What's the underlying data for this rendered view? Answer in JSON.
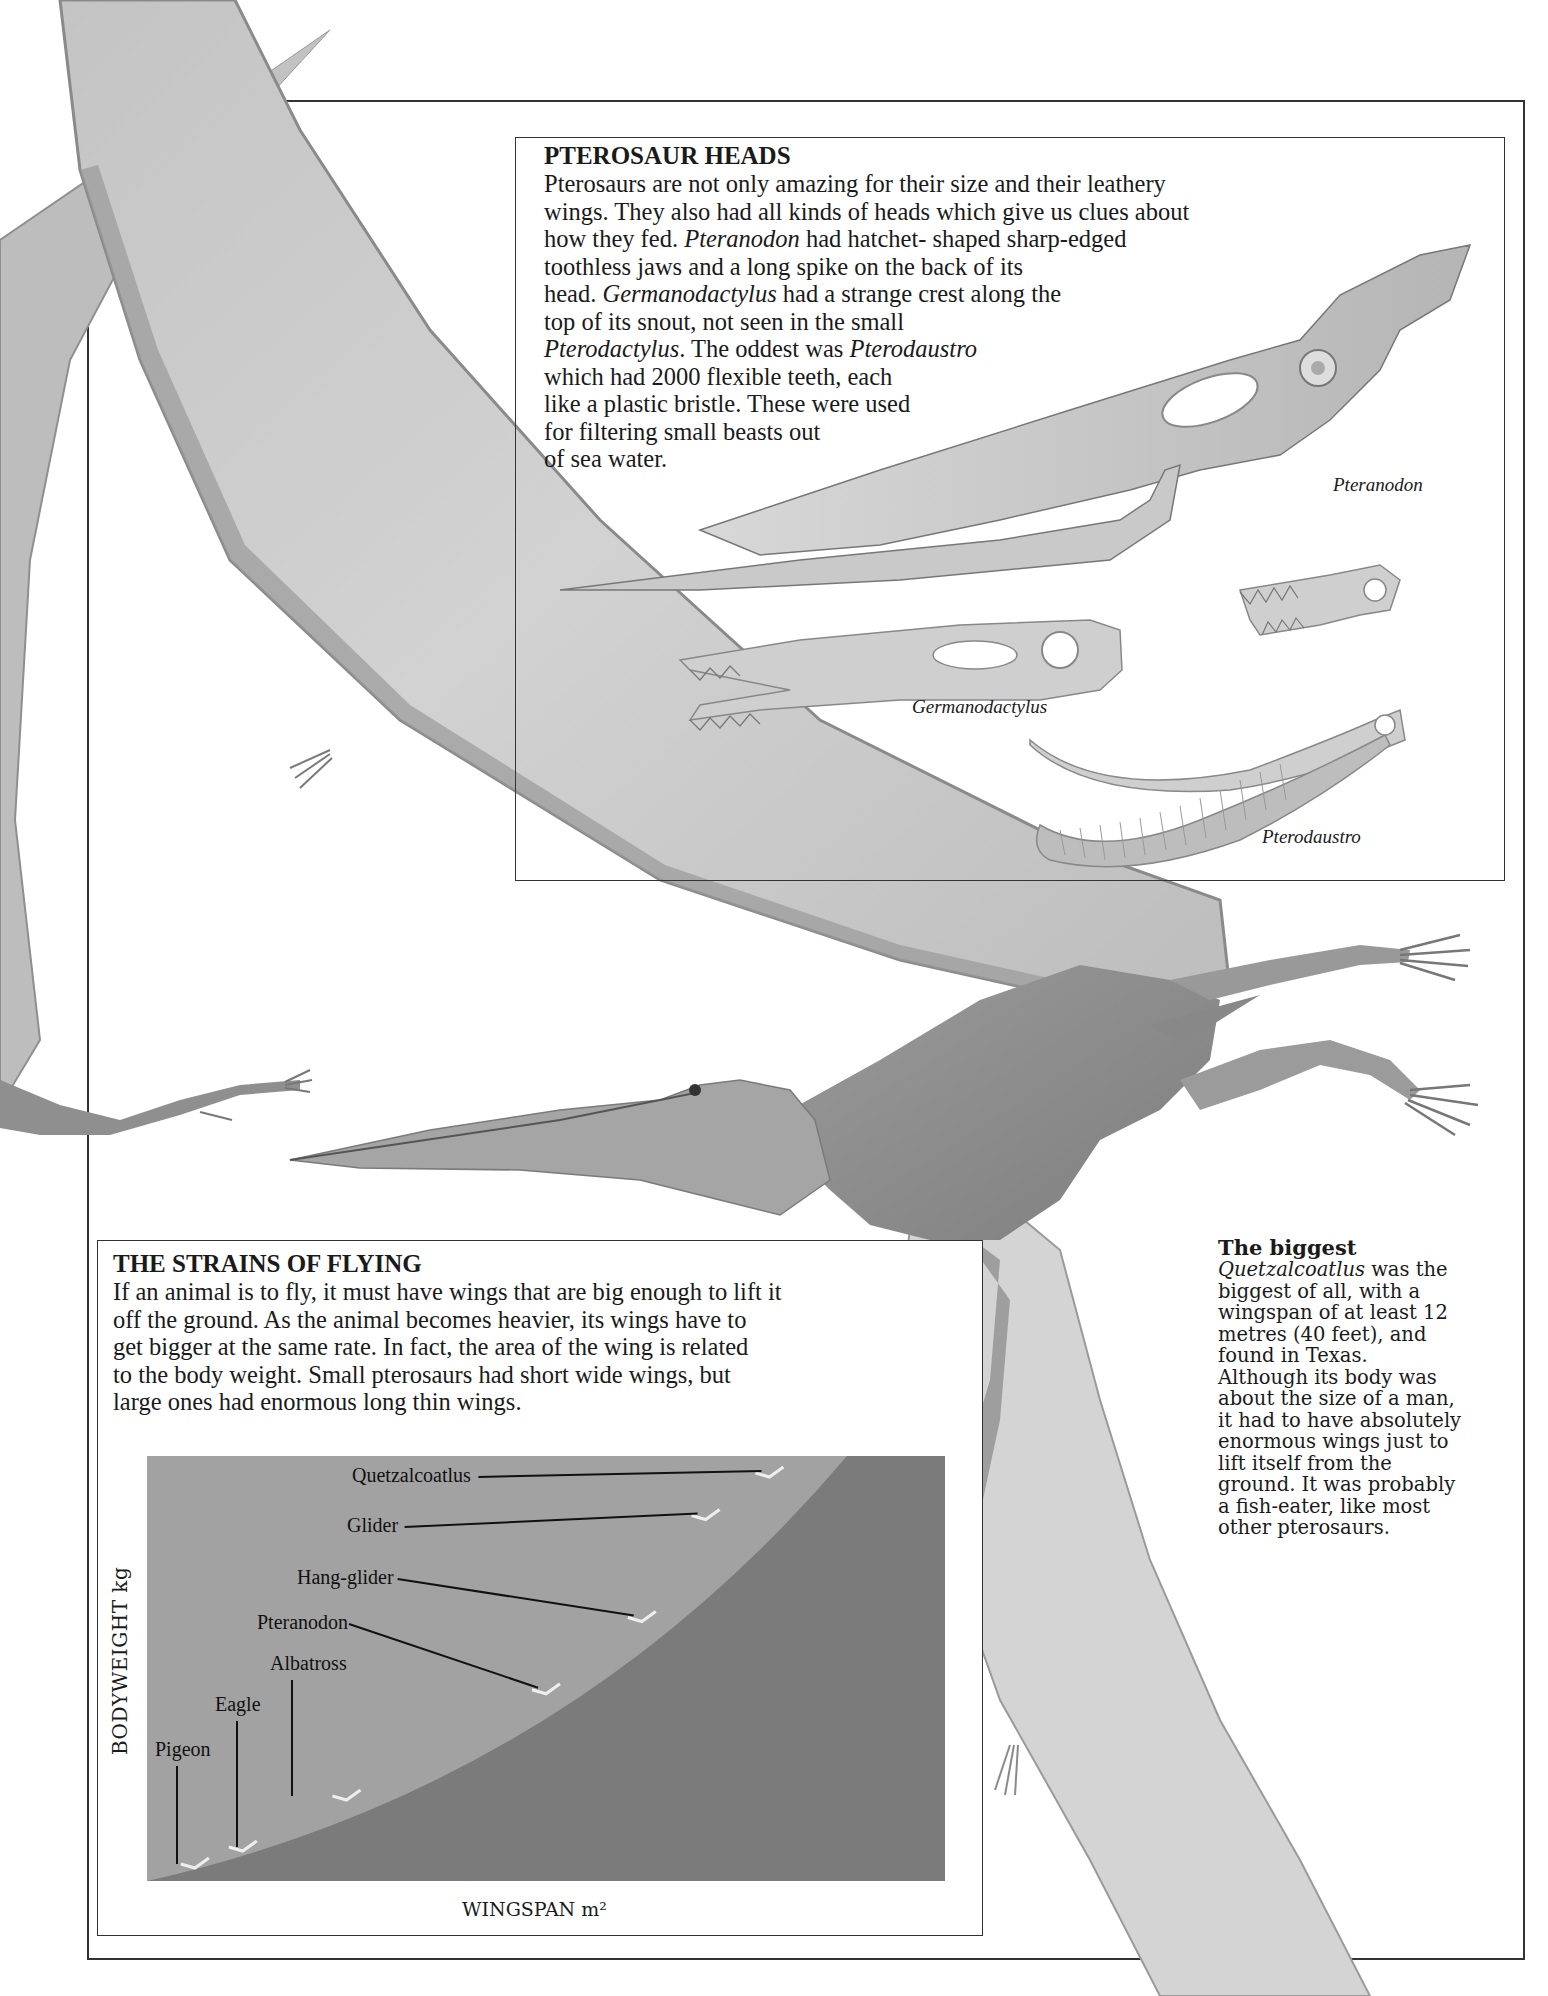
{
  "heads_box": {
    "title": "PTEROSAUR HEADS",
    "lines": [
      "Pterosaurs are not only amazing for their size and their leathery",
      "wings. They also had all kinds of heads which give us clues about",
      "how they fed. |Pteranodon| had hatchet- shaped sharp-edged",
      "toothless jaws and a long spike on the back of its",
      "head. |Germanodactylus| had a strange crest along the",
      "top of its snout, not seen in the small",
      "|Pterodactylus|. The oddest was |Pterodaustro|",
      "which had 2000 flexible teeth, each",
      "like a plastic bristle. These were used",
      "for filtering small beasts out",
      "of sea water."
    ],
    "captions": {
      "pteranodon": "Pteranodon",
      "germanodactylus": "Germanodactylus",
      "pterodaustro": "Pterodaustro"
    }
  },
  "biggest": {
    "title": "The biggest",
    "lines": [
      "|Quetzalcoatlus| was the",
      "biggest of all, with a",
      "wingspan of at least 12",
      "metres (40 feet), and",
      "found in Texas.",
      "Although its body was",
      "about the size of a man,",
      "it had to have absolutely",
      "enormous wings just to",
      "lift itself from the",
      "ground. It was probably",
      "a fish-eater, like most",
      "other pterosaurs."
    ]
  },
  "strains_box": {
    "title": "THE STRAINS OF FLYING",
    "lines": [
      "If an animal is to fly, it must have wings that are big enough to lift it",
      "off the ground. As the animal becomes heavier, its wings have to",
      "get bigger at the same rate. In fact, the area of the wing is related",
      "to the body weight. Small pterosaurs had short wide wings, but",
      "large ones had enormous long thin wings."
    ]
  },
  "colors": {
    "chart_light": "#a2a2a2",
    "chart_dark": "#7b7b7b",
    "wing": "#c9c9c9",
    "wing_edge": "#8a8a8a",
    "body": "#8e8e8e",
    "frame": "#333333"
  },
  "chart_data": {
    "type": "scatter",
    "title": "",
    "xlabel": "WINGSPAN m²",
    "ylabel": "BODYWEIGHT kg",
    "grid": false,
    "legend": "none",
    "annotations": "Labeled flyers placed along a rising curve that separates the lighter upper-left region from the darker lower-right region",
    "points": [
      {
        "label": "Pigeon",
        "x": 0.06,
        "y": 0.04
      },
      {
        "label": "Eagle",
        "x": 0.12,
        "y": 0.08
      },
      {
        "label": "Albatross",
        "x": 0.25,
        "y": 0.2
      },
      {
        "label": "Pteranodon",
        "x": 0.5,
        "y": 0.45
      },
      {
        "label": "Hang-glider",
        "x": 0.62,
        "y": 0.62
      },
      {
        "label": "Glider",
        "x": 0.7,
        "y": 0.86
      },
      {
        "label": "Quetzalcoatlus",
        "x": 0.78,
        "y": 0.96
      }
    ],
    "xlim": [
      0,
      1
    ],
    "ylim": [
      0,
      1
    ],
    "note": "Axes have no numeric ticks; positions are relative (0-1) estimates."
  }
}
